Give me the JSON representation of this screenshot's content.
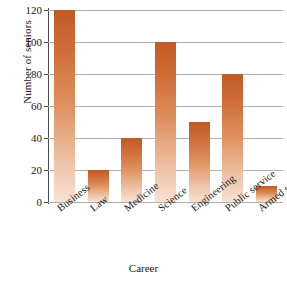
{
  "chart_data": {
    "type": "bar",
    "title": "",
    "subtitle": "",
    "xlabel": "Career",
    "ylabel": "Number of seniors",
    "categories": [
      "Business",
      "Law",
      "Medicine",
      "Science",
      "Engineering",
      "Public service",
      "Armed service"
    ],
    "values": [
      120,
      20,
      40,
      100,
      50,
      80,
      10
    ],
    "series": [
      {
        "name": "Number of seniors",
        "values": [
          120,
          20,
          40,
          100,
          50,
          80,
          10
        ]
      }
    ],
    "ylim": [
      0,
      120
    ],
    "ytick_labels": [
      "0",
      "20",
      "40",
      "60",
      "80",
      "100",
      "120"
    ],
    "ytick_values": [
      0,
      20,
      40,
      60,
      80,
      100,
      120
    ],
    "grid": true,
    "grid_axis": "y",
    "legend": false,
    "legend_position": "none",
    "xtick_rotation": -38,
    "colors": {
      "bar_top": "#c05a26",
      "bar_bottom": "#f7e2d3",
      "gridline": "#b0b0b0",
      "axis": "#4a4a4a",
      "text": "#1a1a1a",
      "background": "#ffffff"
    }
  }
}
